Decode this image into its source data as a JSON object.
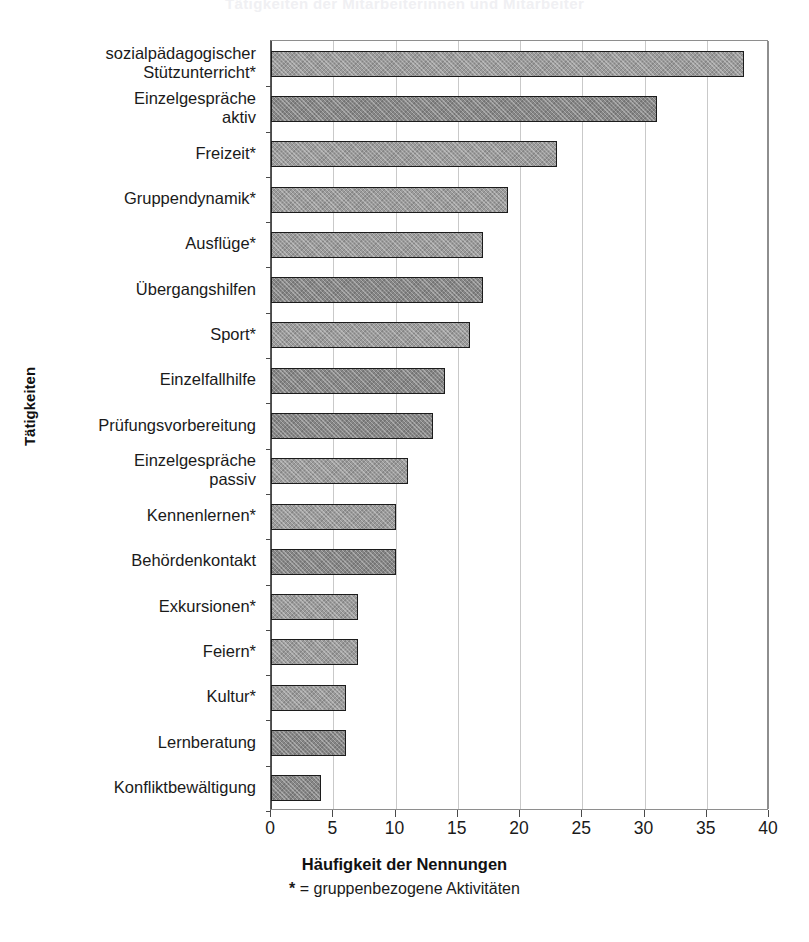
{
  "title_ghost": "Tätigkeiten der Mitarbeiterinnen und Mitarbeiter",
  "axes": {
    "y_title": "Tätigkeiten",
    "x_title": "Häufigkeit der Nennungen",
    "footnote": "* = gruppenbezogene Aktivitäten",
    "footnote_star": "*",
    "footnote_rest": " = gruppenbezogene Aktivitäten"
  },
  "chart_data": {
    "type": "bar",
    "orientation": "horizontal",
    "title": "",
    "xlabel": "Häufigkeit der Nennungen",
    "ylabel": "Tätigkeiten",
    "xlim": [
      0,
      40
    ],
    "xticks": [
      0,
      5,
      10,
      15,
      20,
      25,
      30,
      35,
      40
    ],
    "xtick_labels": [
      "0",
      "5",
      "10",
      "15",
      "20",
      "25",
      "30",
      "35",
      "40"
    ],
    "grid": "vertical",
    "legend": "none",
    "annotation": "* = gruppenbezogene Aktivitäten",
    "categories": [
      "sozialpädagogischer\nStützunterricht*",
      "Einzelgespräche\naktiv",
      "Freizeit*",
      "Gruppendynamik*",
      "Ausflüge*",
      "Übergangshilfen",
      "Sport*",
      "Einzelfallhilfe",
      "Prüfungsvorbereitung",
      "Einzelgespräche\npassiv",
      "Kennenlernen*",
      "Behördenkontakt",
      "Exkursionen*",
      "Feiern*",
      "Kultur*",
      "Lernberatung",
      "Konfliktbewältigung"
    ],
    "values": [
      38,
      31,
      23,
      19,
      17,
      17,
      16,
      14,
      13,
      11,
      10,
      10,
      7,
      7,
      6,
      6,
      4
    ],
    "bar_shades": [
      "light",
      "dark",
      "light",
      "light",
      "light",
      "dark",
      "light",
      "dark",
      "dark",
      "light",
      "light",
      "dark",
      "light",
      "light",
      "light",
      "dark",
      "dark"
    ]
  },
  "colors": {
    "bar_light": "#9b9b9b",
    "bar_dark": "#868686",
    "bar_border": "#1c1c1c",
    "gridline": "#c9c9c9",
    "axis": "#4a4a4a",
    "text": "#1a1a1a",
    "background": "#ffffff"
  }
}
